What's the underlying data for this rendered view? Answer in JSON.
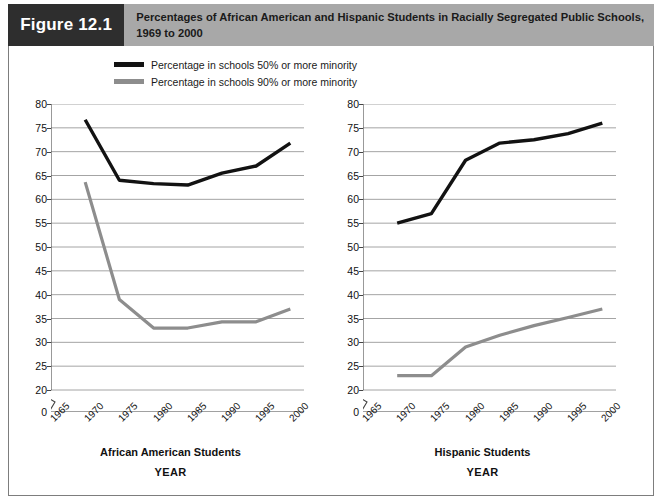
{
  "figure": {
    "badge": "Figure 12.1",
    "title_line1": "Percentages of African American and Hispanic Students in Racially Segregated Public Schools,",
    "title_line2": "1969 to 2000",
    "badge_bg": "#2e2e2e",
    "title_bg": "#a8a8a8"
  },
  "legend": {
    "items": [
      {
        "label": "Percentage in schools 50% or more minority",
        "color": "#121212",
        "key": "pct50"
      },
      {
        "label": "Percentage in schools 90% or more minority",
        "color": "#8d8d8d",
        "key": "pct90"
      }
    ]
  },
  "axis": {
    "y_label": "PERCENTAGE OF STUDENTS",
    "y_ticks": [
      "80",
      "75",
      "70",
      "65",
      "60",
      "55",
      "50",
      "45",
      "40",
      "35",
      "30",
      "25",
      "20",
      "0"
    ],
    "x_ticks": [
      "1965",
      "1970",
      "1975",
      "1980",
      "1985",
      "1990",
      "1995",
      "2000"
    ],
    "x_title": "YEAR",
    "break_note": "axis-break-between-0-and-20"
  },
  "panels": [
    {
      "caption": "African American Students",
      "x_title": "YEAR"
    },
    {
      "caption": "Hispanic Students",
      "x_title": "YEAR"
    }
  ],
  "chart_data": [
    {
      "type": "line",
      "title": "African American Students",
      "xlabel": "YEAR",
      "ylabel": "PERCENTAGE OF STUDENTS",
      "x": [
        1970,
        1975,
        1980,
        1985,
        1990,
        1995,
        2000
      ],
      "xlim": [
        1965,
        2002
      ],
      "ylim": [
        20,
        80
      ],
      "y_axis_break_below": 20,
      "grid": "horizontal",
      "legend_position": "above-top-left",
      "series": [
        {
          "name": "Percentage in schools 50% or more minority",
          "color": "#121212",
          "values": [
            76.7,
            64.0,
            63.3,
            63.0,
            65.5,
            67.0,
            71.8
          ]
        },
        {
          "name": "Percentage in schools 90% or more minority",
          "color": "#8d8d8d",
          "values": [
            63.6,
            39.0,
            33.0,
            33.0,
            34.3,
            34.3,
            37.0
          ]
        }
      ]
    },
    {
      "type": "line",
      "title": "Hispanic Students",
      "xlabel": "YEAR",
      "ylabel": "PERCENTAGE OF STUDENTS",
      "x": [
        1970,
        1975,
        1980,
        1985,
        1990,
        1995,
        2000
      ],
      "xlim": [
        1965,
        2002
      ],
      "ylim": [
        20,
        80
      ],
      "y_axis_break_below": 20,
      "grid": "horizontal",
      "legend_position": "above-top-left",
      "series": [
        {
          "name": "Percentage in schools 50% or more minority",
          "color": "#121212",
          "values": [
            55.0,
            57.0,
            68.2,
            71.8,
            72.5,
            73.8,
            76.0
          ]
        },
        {
          "name": "Percentage in schools 90% or more minority",
          "color": "#8d8d8d",
          "values": [
            23.0,
            23.0,
            29.0,
            31.5,
            33.5,
            35.2,
            37.0
          ]
        }
      ]
    }
  ]
}
